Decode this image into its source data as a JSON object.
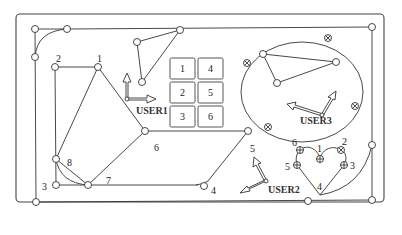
{
  "diagram": {
    "frame": {
      "x": 16,
      "y": 14,
      "w": 368,
      "h": 188,
      "r": 4
    },
    "colors": {
      "stroke": "#333333",
      "background": "#ffffff"
    }
  },
  "outer_path": {
    "points": [
      {
        "id": "a",
        "x": 35,
        "y": 29
      },
      {
        "id": "b",
        "x": 67,
        "y": 29
      },
      {
        "id": "c",
        "x": 35,
        "y": 57
      },
      {
        "id": "d",
        "x": 36,
        "y": 202
      },
      {
        "id": "e",
        "x": 372,
        "y": 27
      },
      {
        "id": "f",
        "x": 372,
        "y": 200
      },
      {
        "id": "g",
        "x": 372,
        "y": 145
      },
      {
        "id": "h",
        "x": 308,
        "y": 201
      }
    ]
  },
  "polygon_path": {
    "labels": {
      "p1": "1",
      "p2": "2",
      "p3": "3",
      "p4": "4",
      "p5": "5",
      "p6": "6",
      "p7": "7",
      "p8": "8"
    },
    "points": {
      "p1": {
        "x": 98,
        "y": 67
      },
      "p2": {
        "x": 55,
        "y": 67
      },
      "p3": {
        "x": 56,
        "y": 185
      },
      "p4": {
        "x": 204,
        "y": 186
      },
      "p5": {
        "x": 248,
        "y": 131
      },
      "p6": {
        "x": 145,
        "y": 131
      },
      "p7": {
        "x": 88,
        "y": 185
      },
      "p8": {
        "x": 56,
        "y": 159
      }
    }
  },
  "user1": {
    "label": "USER1",
    "origin": {
      "x": 127,
      "y": 99
    },
    "triangle": [
      {
        "x": 137,
        "y": 42
      },
      {
        "x": 180,
        "y": 30
      },
      {
        "x": 142,
        "y": 82
      }
    ]
  },
  "button_grid": {
    "buttons": [
      {
        "label": "1",
        "col": 0,
        "row": 0
      },
      {
        "label": "4",
        "col": 1,
        "row": 0
      },
      {
        "label": "2",
        "col": 0,
        "row": 1
      },
      {
        "label": "5",
        "col": 1,
        "row": 1
      },
      {
        "label": "3",
        "col": 0,
        "row": 2
      },
      {
        "label": "6",
        "col": 1,
        "row": 2
      }
    ]
  },
  "user3": {
    "label": "USER3",
    "ellipse": {
      "cx": 302,
      "cy": 92,
      "rx": 61,
      "ry": 50
    },
    "triangle": [
      {
        "x": 263,
        "y": 54
      },
      {
        "x": 336,
        "y": 62
      },
      {
        "x": 277,
        "y": 83
      }
    ]
  },
  "user2": {
    "label": "USER2",
    "label_5": "5"
  },
  "heart": {
    "labels": {
      "h1": "1",
      "h2": "2",
      "h3": "3",
      "h4": "4",
      "h5": "5",
      "h6": "6"
    },
    "points": {
      "h1": {
        "x": 320,
        "y": 159
      },
      "h2": {
        "x": 341,
        "y": 150
      },
      "h3": {
        "x": 344,
        "y": 165
      },
      "h4": {
        "x": 320,
        "y": 195
      },
      "h5": {
        "x": 297,
        "y": 165
      },
      "h6": {
        "x": 300,
        "y": 150
      }
    }
  }
}
